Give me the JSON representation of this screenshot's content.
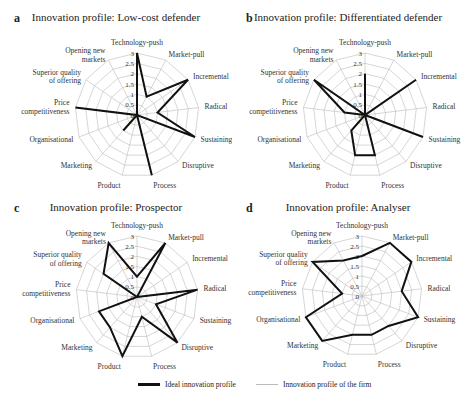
{
  "axes": [
    "Technology-push",
    "Market-pull",
    "Incremental",
    "Radical",
    "Sustaining",
    "Disruptive",
    "Process",
    "Product",
    "Marketing",
    "Organisational",
    "Price competitiveness",
    "Superior quality of offering",
    "Opening new markets"
  ],
  "axis_label_lines": [
    [
      "Technology-push"
    ],
    [
      "Market-pull"
    ],
    [
      "Incremental"
    ],
    [
      "Radical"
    ],
    [
      "Sustaining"
    ],
    [
      "Disruptive"
    ],
    [
      "Process"
    ],
    [
      "Product"
    ],
    [
      "Marketing"
    ],
    [
      "Organisational"
    ],
    [
      "Price",
      "competitiveness"
    ],
    [
      "Superior quality",
      "of offering"
    ],
    [
      "Opening new",
      "markets"
    ]
  ],
  "ticks": [
    "0",
    "0.5",
    "1",
    "1.5",
    "2",
    "2.5",
    "3"
  ],
  "legend": {
    "ideal": "Ideal innovation profile",
    "firm": "Innovation profile of the firm"
  },
  "colors": {
    "ideal": "#111111",
    "grid": "#bbbbbb"
  },
  "panels": [
    {
      "letter": "a",
      "title": "Innovation profile: Low-cost defender"
    },
    {
      "letter": "b",
      "title": "Innovation profile: Differentiated defender"
    },
    {
      "letter": "c",
      "title": "Innovation profile: Prospector"
    },
    {
      "letter": "d",
      "title": "Innovation profile: Analyser"
    }
  ],
  "chart_data": [
    {
      "type": "radar",
      "title": "Innovation profile: Low-cost defender",
      "panel": "a",
      "categories": [
        "Technology-push",
        "Market-pull",
        "Incremental",
        "Radical",
        "Sustaining",
        "Disruptive",
        "Process",
        "Product",
        "Marketing",
        "Organisational",
        "Price competitiveness",
        "Superior quality of offering",
        "Opening new markets"
      ],
      "series": [
        {
          "name": "Ideal innovation profile",
          "values": [
            3,
            1,
            3,
            1,
            3,
            0,
            3,
            0,
            1,
            0,
            3,
            0,
            0
          ]
        }
      ],
      "rlim": [
        0,
        3
      ],
      "rticks": [
        0,
        0.5,
        1,
        1.5,
        2,
        2.5,
        3
      ]
    },
    {
      "type": "radar",
      "title": "Innovation profile: Differentiated defender",
      "panel": "b",
      "categories": [
        "Technology-push",
        "Market-pull",
        "Incremental",
        "Radical",
        "Sustaining",
        "Disruptive",
        "Process",
        "Product",
        "Marketing",
        "Organisational",
        "Price competitiveness",
        "Superior quality of offering",
        "Opening new markets"
      ],
      "series": [
        {
          "name": "Ideal innovation profile",
          "values": [
            2,
            0,
            3,
            0,
            3,
            0,
            2,
            2,
            1,
            0,
            1,
            3,
            0
          ]
        }
      ],
      "rlim": [
        0,
        3
      ],
      "rticks": [
        0,
        0.5,
        1,
        1.5,
        2,
        2.5,
        3
      ]
    },
    {
      "type": "radar",
      "title": "Innovation profile: Prospector",
      "panel": "c",
      "categories": [
        "Technology-push",
        "Market-pull",
        "Incremental",
        "Radical",
        "Sustaining",
        "Disruptive",
        "Process",
        "Product",
        "Marketing",
        "Organisational",
        "Price competitiveness",
        "Superior quality of offering",
        "Opening new markets"
      ],
      "series": [
        {
          "name": "Ideal innovation profile",
          "values": [
            1,
            3,
            0,
            3,
            1,
            3,
            1,
            3,
            2,
            2,
            0,
            2,
            3
          ]
        }
      ],
      "rlim": [
        0,
        3
      ],
      "rticks": [
        0,
        0.5,
        1,
        1.5,
        2,
        2.5,
        3
      ]
    },
    {
      "type": "radar",
      "title": "Innovation profile: Analyser",
      "panel": "d",
      "categories": [
        "Technology-push",
        "Market-pull",
        "Incremental",
        "Radical",
        "Sustaining",
        "Disruptive",
        "Process",
        "Product",
        "Marketing",
        "Organisational",
        "Price competitiveness",
        "Superior quality of offering",
        "Opening new markets"
      ],
      "series": [
        {
          "name": "Ideal innovation profile",
          "values": [
            2,
            3,
            3,
            2,
            3,
            2,
            2,
            2,
            3,
            3,
            1,
            3,
            2
          ]
        }
      ],
      "rlim": [
        0,
        3
      ],
      "rticks": [
        0,
        0.5,
        1,
        1.5,
        2,
        2.5,
        3
      ]
    }
  ]
}
